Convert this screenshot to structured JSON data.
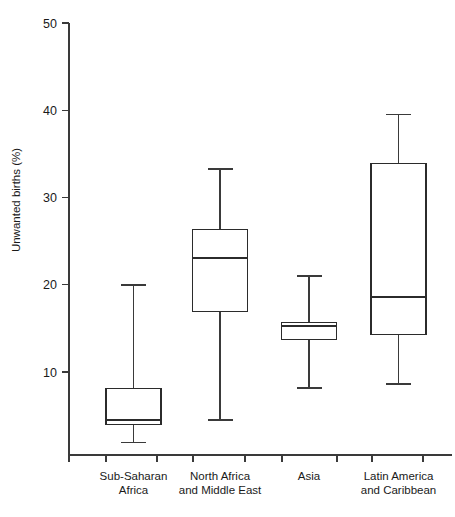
{
  "chart_data": {
    "type": "box",
    "title": "",
    "xlabel": "",
    "ylabel": "Unwanted births (%)",
    "ylim": [
      0,
      50
    ],
    "yticks": [
      10,
      20,
      30,
      40,
      50
    ],
    "ytick_labels": [
      "10",
      "20",
      "30",
      "40",
      "50"
    ],
    "grid": false,
    "legend": "none",
    "categories": [
      "Sub-Saharan Africa",
      "North Africa and Middle East",
      "Asia",
      "Latin America and Caribbean"
    ],
    "category_label_lines": [
      [
        "Sub-Saharan",
        "Africa"
      ],
      [
        "North Africa",
        "and Middle East"
      ],
      [
        "Asia",
        ""
      ],
      [
        "Latin America",
        "and Caribbean"
      ]
    ],
    "boxes": [
      {
        "name": "Sub-Saharan Africa",
        "min": 1.9,
        "q1": 4.0,
        "median": 4.5,
        "q3": 8.1,
        "max": 20.0
      },
      {
        "name": "North Africa and Middle East",
        "min": 4.5,
        "q1": 16.9,
        "median": 23.1,
        "q3": 26.3,
        "max": 33.3
      },
      {
        "name": "Asia",
        "min": 8.2,
        "q1": 13.7,
        "median": 15.3,
        "q3": 15.7,
        "max": 21.0
      },
      {
        "name": "Latin America and Caribbean",
        "min": 8.6,
        "q1": 14.3,
        "median": 18.6,
        "q3": 33.9,
        "max": 39.5
      }
    ]
  },
  "colors": {
    "box_stroke": "#2b2b2b",
    "whisker": "#3a3a3a",
    "axis": "#3a3a3a",
    "text": "#1a1a1a",
    "background": "#ffffff"
  }
}
